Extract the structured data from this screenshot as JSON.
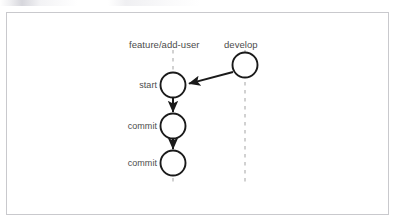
{
  "figure": {
    "type": "git-branch-diagram",
    "frame": {
      "x": 6,
      "y": 12,
      "width": 383,
      "height": 203,
      "border_color": "#c9c9cd",
      "background": "#ffffff"
    },
    "colors": {
      "stroke": "#1a1a1a",
      "branch_line": "#b3b3b3",
      "label_text": "#4c4c4c",
      "node_fill": "#ffffff"
    }
  },
  "branches": [
    {
      "id": "feature",
      "label": "feature/add-user",
      "label_x": 173,
      "label_y": 45,
      "line_x": 173,
      "line_top": 50,
      "line_bottom": 182,
      "style": "dashed"
    },
    {
      "id": "develop",
      "label": "develop",
      "label_x": 245,
      "label_y": 45,
      "line_x": 245,
      "line_top": 50,
      "line_bottom": 182,
      "style": "dashed"
    }
  ],
  "nodes": [
    {
      "id": "develop-head",
      "label": "",
      "branch": "develop",
      "cx": 245,
      "cy": 65,
      "r": 13,
      "label_anchor": "none"
    },
    {
      "id": "feature-start",
      "label": "start",
      "branch": "feature",
      "cx": 173,
      "cy": 85,
      "r": 13,
      "label_anchor": "left",
      "label_x": 157,
      "label_y": 85
    },
    {
      "id": "feature-commit-1",
      "label": "commit",
      "branch": "feature",
      "cx": 173,
      "cy": 126,
      "r": 13,
      "label_anchor": "left",
      "label_x": 157,
      "label_y": 126
    },
    {
      "id": "feature-commit-2",
      "label": "commit",
      "branch": "feature",
      "cx": 173,
      "cy": 163,
      "r": 13,
      "label_anchor": "left",
      "label_x": 157,
      "label_y": 163
    }
  ],
  "edges": [
    {
      "id": "branch-off-arrow",
      "from": "develop-head",
      "to": "feature-start",
      "kind": "branch",
      "x1": 233,
      "y1": 72,
      "x2": 187,
      "y2": 84
    },
    {
      "id": "start-to-commit-1",
      "from": "feature-start",
      "to": "feature-commit-1",
      "kind": "commit",
      "x1": 173,
      "y1": 98,
      "x2": 173,
      "y2": 113
    },
    {
      "id": "commit-1-to-commit-2",
      "from": "feature-commit-1",
      "to": "feature-commit-2",
      "kind": "commit",
      "x1": 173,
      "y1": 139,
      "x2": 173,
      "y2": 150
    }
  ]
}
